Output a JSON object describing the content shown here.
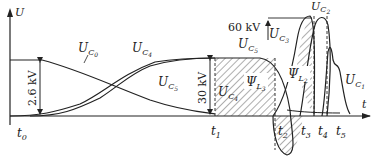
{
  "axes": {
    "y_label": "U",
    "x_label": "t"
  },
  "time_markers": [
    {
      "label": "t",
      "sub": "0"
    },
    {
      "label": "t",
      "sub": "1"
    },
    {
      "label": "t",
      "sub": "2"
    },
    {
      "label": "t",
      "sub": "3"
    },
    {
      "label": "t",
      "sub": "4"
    },
    {
      "label": "t",
      "sub": "5"
    }
  ],
  "curves": {
    "uc0": {
      "main": "U",
      "sub": "C",
      "subsub": "0"
    },
    "uc4_top": {
      "main": "U",
      "sub": "C",
      "subsub": "4"
    },
    "uc5_mid": {
      "main": "U",
      "sub": "C",
      "subsub": "5"
    },
    "uc5_top": {
      "main": "U",
      "sub": "C",
      "subsub": "5"
    },
    "uc4_right": {
      "main": "U",
      "sub": "C",
      "subsub": "4"
    },
    "uc3": {
      "main": "U",
      "sub": "C",
      "subsub": "3"
    },
    "uc2": {
      "main": "U",
      "sub": "C",
      "subsub": "2"
    },
    "uc1": {
      "main": "U",
      "sub": "C",
      "subsub": "1"
    }
  },
  "flux": {
    "psi_l3": {
      "main": "Ψ",
      "sub": "L",
      "subsub": "3"
    },
    "psi_l2": {
      "main": "Ψ",
      "sub": "L",
      "subsub": "2"
    }
  },
  "voltages": {
    "v1": "2.6 kV",
    "v2": "30 kV",
    "v3": "60 kV"
  }
}
